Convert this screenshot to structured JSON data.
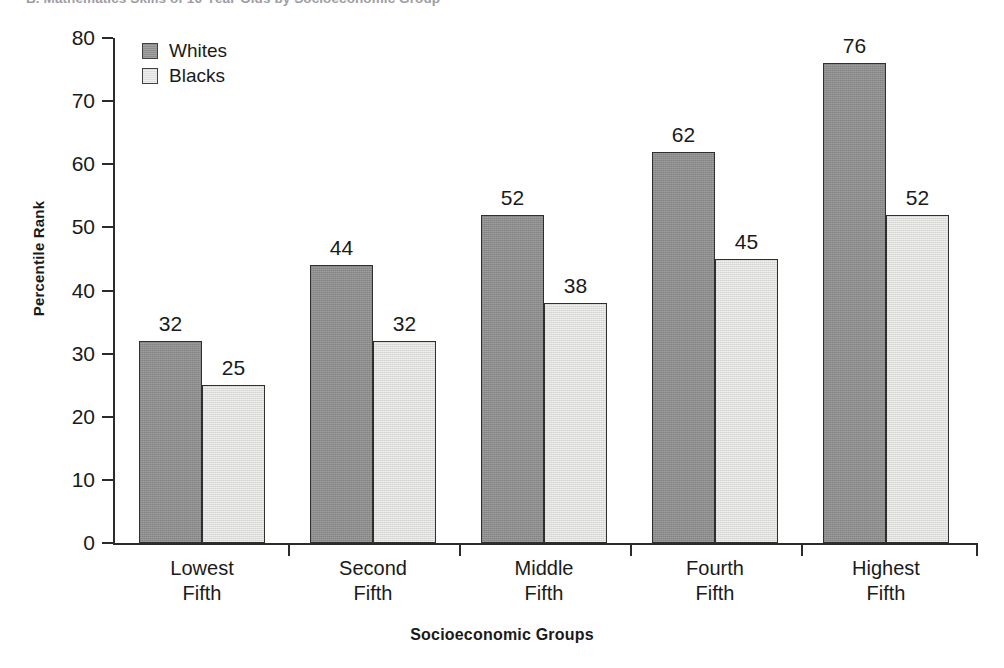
{
  "chart_data": {
    "type": "bar",
    "title": "B. Mathematics Skills of 16-Year-Olds by Socioeconomic Group",
    "xlabel": "Socioeconomic Groups",
    "ylabel": "Percentile Rank",
    "ylim": [
      0,
      80
    ],
    "yticks": [
      0,
      10,
      20,
      30,
      40,
      50,
      60,
      70,
      80
    ],
    "ytick_labels": [
      "0",
      "10",
      "20",
      "30",
      "40",
      "50",
      "60",
      "70",
      "80"
    ],
    "grid": false,
    "legend_position": "top-left-inside",
    "categories": [
      "Lowest Fifth",
      "Second Fifth",
      "Middle Fifth",
      "Fourth Fifth",
      "Highest Fifth"
    ],
    "category_lines": [
      [
        "Lowest",
        "Fifth"
      ],
      [
        "Second",
        "Fifth"
      ],
      [
        "Middle",
        "Fifth"
      ],
      [
        "Fourth",
        "Fifth"
      ],
      [
        "Highest",
        "Fifth"
      ]
    ],
    "series": [
      {
        "name": "Whites",
        "color": "#8d8d8d",
        "values": [
          32,
          44,
          52,
          62,
          76
        ],
        "labels": [
          "32",
          "44",
          "52",
          "62",
          "76"
        ]
      },
      {
        "name": "Blacks",
        "color": "#dededd",
        "values": [
          25,
          32,
          38,
          45,
          52
        ],
        "labels": [
          "25",
          "32",
          "38",
          "45",
          "52"
        ]
      }
    ]
  },
  "legend": {
    "items": [
      {
        "label": "Whites",
        "swatch": "dark-gray"
      },
      {
        "label": "Blacks",
        "swatch": "light-gray"
      }
    ]
  }
}
